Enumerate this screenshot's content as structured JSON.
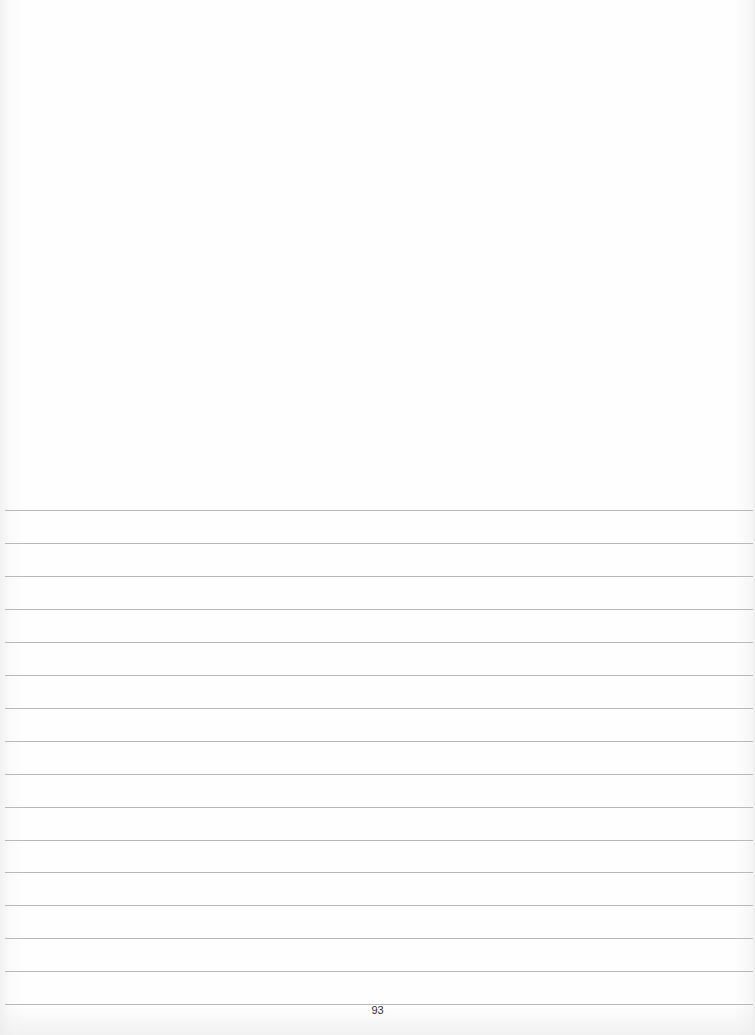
{
  "document": {
    "type": "lined notebook page",
    "page_number": "93",
    "rule_count": 16,
    "first_rule_y": 510,
    "rule_spacing_px": 32.95,
    "rule_color": "#b9b9b9",
    "paper_color": "#fdfdfd"
  }
}
